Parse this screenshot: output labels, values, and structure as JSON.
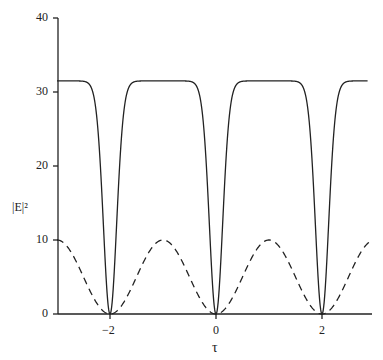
{
  "chart_data": {
    "type": "line",
    "title": "",
    "xlabel": "τ",
    "ylabel": "|E|²",
    "xlim": [
      -3.0,
      2.95
    ],
    "ylim": [
      0,
      40
    ],
    "x_ticks": [
      -2,
      0,
      2
    ],
    "y_ticks": [
      0,
      10,
      20,
      30,
      40
    ],
    "grid": false,
    "legend": "none",
    "series": [
      {
        "name": "solid",
        "style": "solid",
        "description": "Plateau near 31.5 with sharp dips to 0 at τ = -2, 0, 2",
        "x": [
          -3.0,
          -2.6,
          -2.4,
          -2.2,
          -2.1,
          -2.0,
          -1.9,
          -1.8,
          -1.6,
          -1.4,
          -1.0,
          -0.6,
          -0.4,
          -0.2,
          -0.1,
          0.0,
          0.1,
          0.2,
          0.4,
          0.6,
          1.0,
          1.4,
          1.6,
          1.8,
          1.9,
          2.0,
          2.1,
          2.2,
          2.4,
          2.6,
          2.85
        ],
        "values": [
          31.5,
          31.3,
          30.2,
          22.0,
          12.0,
          0.0,
          12.0,
          22.0,
          30.2,
          31.3,
          31.5,
          31.3,
          30.2,
          22.0,
          12.0,
          0.0,
          12.0,
          22.0,
          30.2,
          31.3,
          31.5,
          31.3,
          30.2,
          22.0,
          12.0,
          0.0,
          12.0,
          22.0,
          30.2,
          31.3,
          31.5
        ]
      },
      {
        "name": "dashed",
        "style": "dashed",
        "description": "10·sin²(πτ/2): peaks of 10 at τ = -3, -1, 1, 3; zeros at τ = -2, 0, 2",
        "x": [
          -3.0,
          -2.5,
          -2.0,
          -1.5,
          -1.0,
          -0.5,
          0.0,
          0.5,
          1.0,
          1.5,
          2.0,
          2.5,
          2.95
        ],
        "values": [
          10,
          5,
          0,
          5,
          10,
          5,
          0,
          5,
          10,
          5,
          0,
          5,
          9.9
        ]
      }
    ]
  }
}
